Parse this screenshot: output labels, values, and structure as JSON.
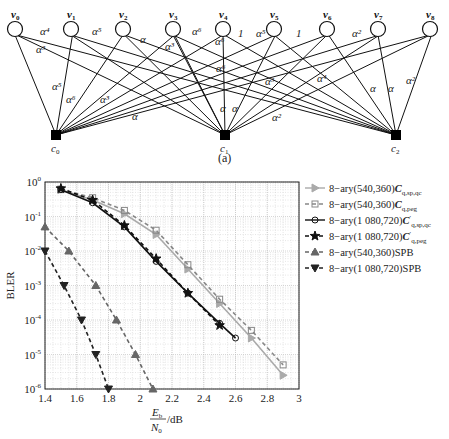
{
  "figure": {
    "subcaption": "(a)",
    "graph": {
      "variable_nodes": [
        {
          "name": "v0",
          "x": 15,
          "y": 29
        },
        {
          "name": "v1",
          "x": 71,
          "y": 29
        },
        {
          "name": "v2",
          "x": 123,
          "y": 29
        },
        {
          "name": "v3",
          "x": 173,
          "y": 29
        },
        {
          "name": "v4",
          "x": 223,
          "y": 29
        },
        {
          "name": "v5",
          "x": 274,
          "y": 29
        },
        {
          "name": "v6",
          "x": 327,
          "y": 29
        },
        {
          "name": "v7",
          "x": 378,
          "y": 29
        },
        {
          "name": "v8",
          "x": 430,
          "y": 29
        }
      ],
      "check_nodes": [
        {
          "name": "c0",
          "x": 56,
          "y": 135
        },
        {
          "name": "c1",
          "x": 225,
          "y": 135
        },
        {
          "name": "c2",
          "x": 396,
          "y": 135
        }
      ],
      "edge_labels": [
        {
          "text": "α⁴",
          "x": 40,
          "y": 35
        },
        {
          "text": "α³",
          "x": 36,
          "y": 53
        },
        {
          "text": "α⁵",
          "x": 92,
          "y": 35
        },
        {
          "text": "α",
          "x": 140,
          "y": 43
        },
        {
          "text": "α³",
          "x": 165,
          "y": 50
        },
        {
          "text": "α⁶",
          "x": 192,
          "y": 35
        },
        {
          "text": "α⁶",
          "x": 215,
          "y": 45
        },
        {
          "text": "1",
          "x": 238,
          "y": 37
        },
        {
          "text": "α⁵",
          "x": 256,
          "y": 37
        },
        {
          "text": "1",
          "x": 296,
          "y": 37
        },
        {
          "text": "α²",
          "x": 352,
          "y": 37
        },
        {
          "text": "α⁶",
          "x": 216,
          "y": 72
        },
        {
          "text": "α³",
          "x": 265,
          "y": 85
        },
        {
          "text": "α⁴",
          "x": 317,
          "y": 82
        },
        {
          "text": "α⁵",
          "x": 52,
          "y": 90
        },
        {
          "text": "α⁶",
          "x": 66,
          "y": 103
        },
        {
          "text": "α³",
          "x": 100,
          "y": 103
        },
        {
          "text": "α",
          "x": 132,
          "y": 120
        },
        {
          "text": "α",
          "x": 220,
          "y": 112
        },
        {
          "text": "α",
          "x": 232,
          "y": 112
        },
        {
          "text": "α²",
          "x": 272,
          "y": 121
        },
        {
          "text": "α",
          "x": 370,
          "y": 92
        },
        {
          "text": "α",
          "x": 388,
          "y": 92
        },
        {
          "text": "α²",
          "x": 406,
          "y": 84
        }
      ]
    }
  },
  "chart_data": {
    "type": "line",
    "title": "",
    "xlabel": "Eb/N0 /dB",
    "ylabel": "BLER",
    "xlim": [
      1.4,
      3.0
    ],
    "ylim": [
      1e-06,
      1
    ],
    "yscale": "log",
    "grid": true,
    "legend_position": "right-outside-top",
    "x_ticks": [
      "1.4",
      "1.6",
      "1.8",
      "2",
      "2.2",
      "2.4",
      "2.6",
      "2.8",
      "3"
    ],
    "y_ticks": [
      "10^0",
      "10^-1",
      "10^-2",
      "10^-3",
      "10^-4",
      "10^-5",
      "10^-6"
    ],
    "series": [
      {
        "name": "8-ary(540,360) Cq,sp,qc",
        "style": "solid",
        "color": "#aaaaaa",
        "marker": "triangle-right",
        "x": [
          1.5,
          1.7,
          1.9,
          2.1,
          2.3,
          2.5,
          2.7,
          2.9
        ],
        "y": [
          0.6,
          0.3,
          0.12,
          0.03,
          0.003,
          0.0003,
          3e-05,
          2.5e-06
        ]
      },
      {
        "name": "8-ary(540,360) Cq,peg",
        "style": "dashed",
        "color": "#888888",
        "marker": "square",
        "x": [
          1.5,
          1.7,
          1.9,
          2.1,
          2.3,
          2.5,
          2.7,
          2.9
        ],
        "y": [
          0.6,
          0.35,
          0.15,
          0.04,
          0.004,
          0.0004,
          5e-05,
          5e-06
        ]
      },
      {
        "name": "8-ary(1 080,720) C'q,sp,qc",
        "style": "solid",
        "color": "#111111",
        "marker": "circle",
        "x": [
          1.5,
          1.7,
          1.9,
          2.1,
          2.3,
          2.5,
          2.6
        ],
        "y": [
          0.6,
          0.25,
          0.05,
          0.005,
          0.0006,
          8e-05,
          3e-05
        ]
      },
      {
        "name": "8-ary(1 080,720) C'q,peg",
        "style": "dashed",
        "color": "#111111",
        "marker": "star",
        "x": [
          1.5,
          1.7,
          1.9,
          2.1,
          2.3,
          2.5
        ],
        "y": [
          0.65,
          0.3,
          0.055,
          0.006,
          0.0006,
          7e-05
        ]
      },
      {
        "name": "8-ary(540,360)SPB",
        "style": "dashed",
        "color": "#666666",
        "marker": "triangle-up",
        "x": [
          1.4,
          1.55,
          1.72,
          1.85,
          1.97,
          2.08
        ],
        "y": [
          0.05,
          0.01,
          0.001,
          0.0001,
          1e-05,
          1e-06
        ]
      },
      {
        "name": "8-ary(1 080,720)SPB",
        "style": "dashed",
        "color": "#222222",
        "marker": "triangle-down",
        "x": [
          1.4,
          1.52,
          1.63,
          1.72,
          1.8
        ],
        "y": [
          0.01,
          0.001,
          0.0001,
          1e-05,
          1e-06
        ]
      }
    ]
  },
  "legend": [
    {
      "prefix": "8−ary(540,360)",
      "code": "C",
      "sub": "q,sp,qc",
      "prime": ""
    },
    {
      "prefix": "8−ary(540,360)",
      "code": "C",
      "sub": "q,peg",
      "prime": ""
    },
    {
      "prefix": "8−ary(1 080,720)",
      "code": "C",
      "sub": "q,sp,qc",
      "prime": "′"
    },
    {
      "prefix": "8−ary(1 080,720)",
      "code": "C",
      "sub": "q,peg",
      "prime": "′"
    },
    {
      "prefix": "8−ary(540,360)SPB",
      "code": "",
      "sub": "",
      "prime": ""
    },
    {
      "prefix": "8−ary(1 080,720)SPB",
      "code": "",
      "sub": "",
      "prime": ""
    }
  ],
  "axis": {
    "ylabel": "BLER",
    "xlabel_num": "E",
    "xlabel_num_sub": "b",
    "xlabel_den": "N",
    "xlabel_den_sub": "0",
    "xlabel_unit": "/dB"
  }
}
